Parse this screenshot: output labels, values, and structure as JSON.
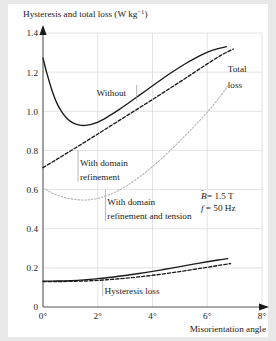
{
  "chart_data": {
    "type": "line",
    "title_main": "Hysteresis and total loss (W kg",
    "title_unit_sup": "−1",
    "title_tail": ")",
    "xlabel": "Misorientation angle",
    "ylabel": "",
    "xlim": [
      0,
      8
    ],
    "ylim": [
      0,
      1.4
    ],
    "grid": true,
    "legend": "inline-annotations",
    "xticks": [
      "0°",
      "2°",
      "4°",
      "6°",
      "8°"
    ],
    "xtick_values": [
      0,
      2,
      4,
      6,
      8
    ],
    "yticks": [
      "0",
      "0.2",
      "0.4",
      "0.6",
      "0.8",
      "1.0",
      "1.2",
      "1.4"
    ],
    "ytick_values": [
      0,
      0.2,
      0.4,
      0.6,
      0.8,
      1.0,
      1.2,
      1.4
    ],
    "annotations": [
      {
        "id": "without",
        "text": "Without",
        "x": 1.95,
        "y": 1.095
      },
      {
        "id": "total-loss-line1",
        "text": "Total",
        "x": 6.75,
        "y": 1.215
      },
      {
        "id": "total-loss-line2",
        "text": "loss",
        "x": 6.75,
        "y": 1.135
      },
      {
        "id": "with-domain-refinement-line1",
        "text": "With domain",
        "x": 1.35,
        "y": 0.735
      },
      {
        "id": "with-domain-refinement-line2",
        "text": "refinement",
        "x": 1.35,
        "y": 0.665
      },
      {
        "id": "with-domain-refinement-tension-line1",
        "text": "With domain",
        "x": 2.35,
        "y": 0.535
      },
      {
        "id": "with-domain-refinement-tension-line2",
        "text": "refinement and tension",
        "x": 2.35,
        "y": 0.465
      },
      {
        "id": "hysteresis-loss",
        "text": "Hysteresis loss",
        "x": 2.25,
        "y": 0.085
      }
    ],
    "condition_b_symbol": "B",
    "condition_b_text": " = 1.5 T",
    "condition_f_symbol": "f",
    "condition_f_text": " = 50 Hz",
    "series": [
      {
        "name": "Total loss — Without",
        "style": "solid",
        "color": "#1a1a1a",
        "points": [
          [
            0.0,
            1.272
          ],
          [
            0.12,
            1.205
          ],
          [
            0.25,
            1.142
          ],
          [
            0.38,
            1.086
          ],
          [
            0.52,
            1.038
          ],
          [
            0.68,
            0.998
          ],
          [
            0.85,
            0.967
          ],
          [
            1.02,
            0.947
          ],
          [
            1.2,
            0.934
          ],
          [
            1.4,
            0.928
          ],
          [
            1.62,
            0.929
          ],
          [
            1.85,
            0.937
          ],
          [
            2.1,
            0.951
          ],
          [
            2.4,
            0.975
          ],
          [
            2.75,
            1.006
          ],
          [
            3.1,
            1.04
          ],
          [
            3.5,
            1.08
          ],
          [
            3.9,
            1.12
          ],
          [
            4.3,
            1.16
          ],
          [
            4.75,
            1.203
          ],
          [
            5.2,
            1.243
          ],
          [
            5.7,
            1.282
          ],
          [
            6.2,
            1.312
          ],
          [
            6.7,
            1.33
          ]
        ]
      },
      {
        "name": "Total loss — With domain refinement",
        "style": "dashed",
        "color": "#1a1a1a",
        "points": [
          [
            0.0,
            0.712
          ],
          [
            0.5,
            0.754
          ],
          [
            1.0,
            0.797
          ],
          [
            1.5,
            0.84
          ],
          [
            2.0,
            0.884
          ],
          [
            2.5,
            0.928
          ],
          [
            3.0,
            0.972
          ],
          [
            3.5,
            1.016
          ],
          [
            4.0,
            1.06
          ],
          [
            4.5,
            1.105
          ],
          [
            5.0,
            1.15
          ],
          [
            5.5,
            1.196
          ],
          [
            6.0,
            1.242
          ],
          [
            6.5,
            1.286
          ],
          [
            6.95,
            1.318
          ]
        ]
      },
      {
        "name": "Total loss — With domain refinement and tension",
        "style": "dotted",
        "color": "#b5b5b5",
        "points": [
          [
            0.0,
            0.61
          ],
          [
            0.25,
            0.588
          ],
          [
            0.5,
            0.572
          ],
          [
            0.8,
            0.559
          ],
          [
            1.1,
            0.551
          ],
          [
            1.4,
            0.547
          ],
          [
            1.7,
            0.548
          ],
          [
            2.0,
            0.555
          ],
          [
            2.35,
            0.57
          ],
          [
            2.7,
            0.591
          ],
          [
            3.05,
            0.619
          ],
          [
            3.45,
            0.657
          ],
          [
            3.85,
            0.7
          ],
          [
            4.25,
            0.748
          ],
          [
            4.65,
            0.8
          ],
          [
            5.05,
            0.855
          ],
          [
            5.45,
            0.912
          ],
          [
            5.85,
            0.972
          ],
          [
            6.2,
            1.028
          ],
          [
            6.55,
            1.09
          ],
          [
            6.8,
            1.14
          ]
        ]
      },
      {
        "name": "Hysteresis loss — Without",
        "style": "solid",
        "color": "#1a1a1a",
        "points": [
          [
            0.0,
            0.132
          ],
          [
            0.5,
            0.133
          ],
          [
            1.0,
            0.135
          ],
          [
            1.5,
            0.139
          ],
          [
            2.0,
            0.145
          ],
          [
            2.5,
            0.152
          ],
          [
            3.0,
            0.161
          ],
          [
            3.5,
            0.171
          ],
          [
            4.0,
            0.182
          ],
          [
            4.5,
            0.194
          ],
          [
            5.0,
            0.206
          ],
          [
            5.5,
            0.219
          ],
          [
            6.0,
            0.231
          ],
          [
            6.4,
            0.24
          ],
          [
            6.75,
            0.247
          ]
        ]
      },
      {
        "name": "Hysteresis loss — With domain refinement",
        "style": "dashed",
        "color": "#1a1a1a",
        "points": [
          [
            0.0,
            0.13
          ],
          [
            0.5,
            0.13
          ],
          [
            1.0,
            0.131
          ],
          [
            1.5,
            0.133
          ],
          [
            2.0,
            0.136
          ],
          [
            2.5,
            0.141
          ],
          [
            3.0,
            0.147
          ],
          [
            3.5,
            0.154
          ],
          [
            4.0,
            0.162
          ],
          [
            4.5,
            0.171
          ],
          [
            5.0,
            0.181
          ],
          [
            5.5,
            0.192
          ],
          [
            6.0,
            0.203
          ],
          [
            6.4,
            0.212
          ],
          [
            6.85,
            0.222
          ]
        ]
      }
    ]
  }
}
